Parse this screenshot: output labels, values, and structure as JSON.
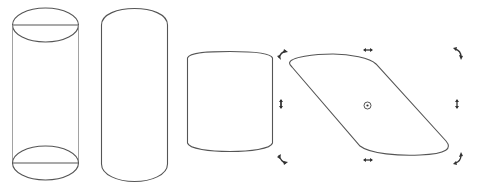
{
  "figure": {
    "colors": {
      "stroke": "#555555",
      "thin_stroke": "#8a8a8a",
      "handle": "#333333",
      "background": "#ffffff"
    },
    "shapes": [
      {
        "id": "cylinder-wireframe",
        "label": ""
      },
      {
        "id": "cylinder-outline",
        "label": ""
      },
      {
        "id": "cylinder-scaled",
        "label": ""
      },
      {
        "id": "cylinder-skewed",
        "label": ""
      }
    ],
    "handles": {
      "rotate": [
        "top-left",
        "top-right",
        "bottom-left",
        "bottom-right"
      ],
      "skew_horizontal": [
        "top",
        "bottom"
      ],
      "skew_vertical": [
        "left",
        "right"
      ],
      "center": "rotation-center"
    }
  }
}
